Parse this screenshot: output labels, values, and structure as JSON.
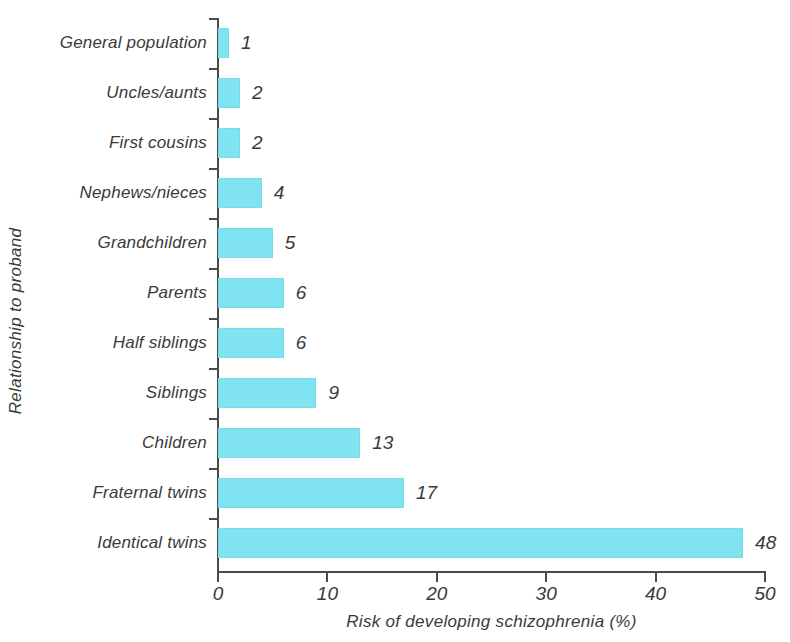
{
  "chart_data": {
    "type": "bar",
    "orientation": "horizontal",
    "title": "",
    "xlabel": "Risk of developing schizophrenia (%)",
    "ylabel": "Relationship to proband",
    "xlim": [
      0,
      50
    ],
    "xticks": [
      0,
      10,
      20,
      30,
      40,
      50
    ],
    "grid": false,
    "legend": false,
    "bar_color": "#7fe3f0",
    "value_labels_shown": true,
    "categories": [
      "General population",
      "Uncles/aunts",
      "First cousins",
      "Nephews/nieces",
      "Grandchildren",
      "Parents",
      "Half siblings",
      "Siblings",
      "Children",
      "Fraternal twins",
      "Identical twins"
    ],
    "values": [
      1,
      2,
      2,
      4,
      5,
      6,
      6,
      9,
      13,
      17,
      48
    ],
    "value_label_texts": [
      "1",
      "2",
      "2",
      "4",
      "5",
      "6",
      "6",
      "9",
      "13",
      "17",
      "48"
    ],
    "xtick_labels": [
      "0",
      "10",
      "20",
      "30",
      "40",
      "50"
    ]
  }
}
